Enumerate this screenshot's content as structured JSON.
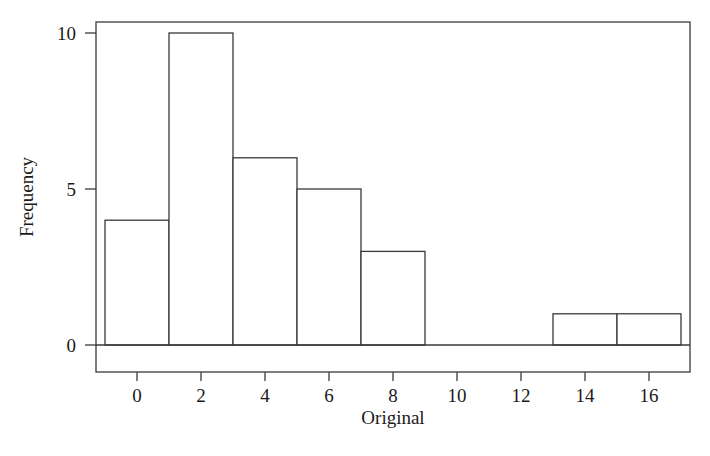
{
  "chart_data": {
    "type": "bar",
    "title": "",
    "subtitle": "",
    "xlabel": "Original",
    "ylabel": "Frequency",
    "xlim": [
      -1.45,
      17.6
    ],
    "ylim": [
      0,
      11.2
    ],
    "grid": false,
    "legend": null,
    "bin_width": 2,
    "bin_edges": [
      -1,
      1,
      3,
      5,
      7,
      9,
      11,
      13,
      15,
      17
    ],
    "categories": [
      "-1 to 1",
      "1 to 3",
      "3 to 5",
      "5 to 7",
      "7 to 9",
      "9 to 11",
      "11 to 13",
      "13 to 15",
      "15 to 17"
    ],
    "values": [
      4,
      10,
      6,
      5,
      3,
      0,
      0,
      1,
      1
    ],
    "bars": [
      {
        "left": -1,
        "right": 1,
        "value": 4
      },
      {
        "left": 1,
        "right": 3,
        "value": 10
      },
      {
        "left": 3,
        "right": 5,
        "value": 6
      },
      {
        "left": 5,
        "right": 7,
        "value": 5
      },
      {
        "left": 7,
        "right": 9,
        "value": 3
      },
      {
        "left": 13,
        "right": 15,
        "value": 1
      },
      {
        "left": 15,
        "right": 17,
        "value": 1
      }
    ],
    "xticks": [
      0,
      2,
      4,
      6,
      8,
      10,
      12,
      14,
      16
    ],
    "xticklabels": [
      "0",
      "2",
      "4",
      "6",
      "8",
      "10",
      "12",
      "14",
      "16"
    ],
    "yticks": [
      0,
      5,
      10
    ],
    "yticklabels": [
      "0",
      "5",
      "10"
    ],
    "colors": {
      "bar_fill": "#ffffff",
      "bar_stroke": "#3a3a3a",
      "axis": "#3a3a3a",
      "text": "#1a1a1a",
      "background": "#ffffff"
    }
  }
}
